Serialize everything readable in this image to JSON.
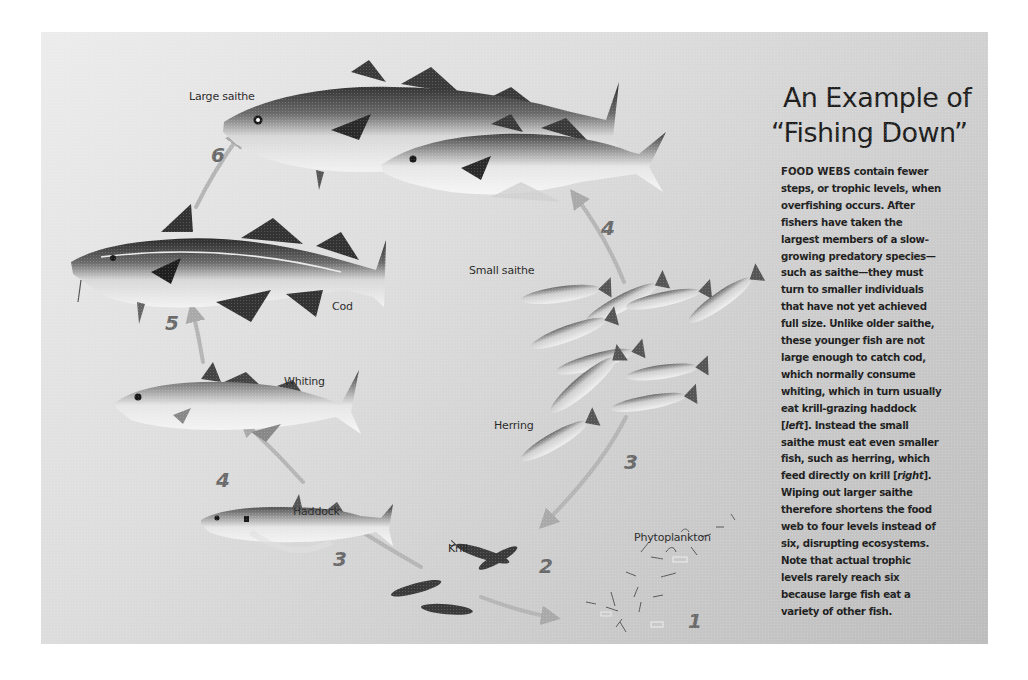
{
  "title": {
    "line1": "An Example of",
    "line2": "“Fishing Down”"
  },
  "body": {
    "lead": "FOOD WEBS",
    "lines": [
      " contain fewer",
      "steps, or trophic levels, when",
      "overfishing occurs. After",
      "fishers have taken the",
      "largest members of a slow-",
      "growing predatory species—",
      "such as saithe—they must",
      "turn to smaller individuals",
      "that have not yet achieved",
      "full size. Unlike older saithe,",
      "these younger fish are not",
      "large enough to catch cod,",
      "which normally consume",
      "whiting, which in turn usually",
      "eat krill-grazing haddock",
      "[",
      "left",
      "]. Instead the small",
      "saithe must eat even smaller",
      "fish, such as herring, which",
      "feed directly on krill [",
      "right",
      "].",
      "Wiping out larger saithe",
      "therefore shortens the food",
      "web to four levels instead of",
      "six, disrupting ecosystems.",
      "Note that actual trophic",
      "levels rarely reach six",
      "because large fish eat a",
      "variety of other fish."
    ]
  },
  "species": [
    {
      "id": "large-saithe",
      "label": "Large saithe",
      "level": "6"
    },
    {
      "id": "small-saithe",
      "label": "Small saithe",
      "level": "4"
    },
    {
      "id": "cod",
      "label": "Cod",
      "level": "5"
    },
    {
      "id": "whiting",
      "label": "Whiting",
      "level": "4"
    },
    {
      "id": "haddock",
      "label": "Haddock",
      "level": "3"
    },
    {
      "id": "herring",
      "label": "Herring",
      "level": "3"
    },
    {
      "id": "krill",
      "label": "Krill",
      "level": "2"
    },
    {
      "id": "phytoplankton",
      "label": "Phytoplankton",
      "level": "1"
    }
  ],
  "chains": {
    "left": [
      "Large saithe",
      "Cod",
      "Whiting",
      "Haddock",
      "Krill",
      "Phytoplankton"
    ],
    "right": [
      "Small saithe",
      "Herring",
      "Krill",
      "Phytoplankton"
    ]
  },
  "colors": {
    "panel_light": "#ececec",
    "panel_dark": "#bdbdbd",
    "text": "#1e1e1e",
    "level_number": "#6a6a6a",
    "arrow": "#a9a9a9"
  }
}
